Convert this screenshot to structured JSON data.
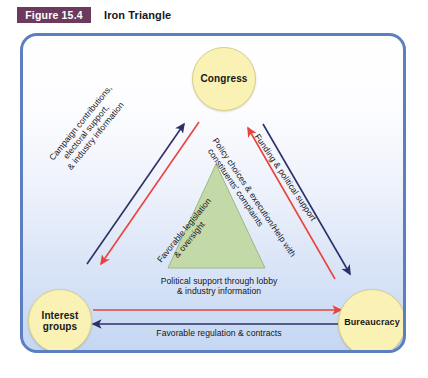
{
  "figure": {
    "badge": "Figure 15.4",
    "title": "Iron Triangle"
  },
  "nodes": {
    "congress": "Congress",
    "interest_groups_line1": "Interest",
    "interest_groups_line2": "groups",
    "bureaucracy": "Bureaucracy"
  },
  "edges": {
    "campaign_line1": "Campaign contributions,",
    "campaign_line2": "electoral support,",
    "campaign_line3": "& industry information",
    "favorable_legislation_line1": "Favorable legislation",
    "favorable_legislation_line2": "& oversight",
    "funding": "Funding & political support",
    "policy_choices_line1": "Policy choices & execution/Help with",
    "policy_choices_line2": "constituents' complaints",
    "political_support_line1": "Political support through lobby",
    "political_support_line2": "& industry information",
    "favorable_regulation": "Favorable regulation & contracts"
  },
  "colors": {
    "badge_bg": "#6d3a5d",
    "frame_border": "#5b7fc0",
    "node_fill": "#f9f2b4",
    "triangle_fill": "#c3d9a8",
    "arrow_navy": "#2e2f66",
    "arrow_red": "#e8433f"
  }
}
